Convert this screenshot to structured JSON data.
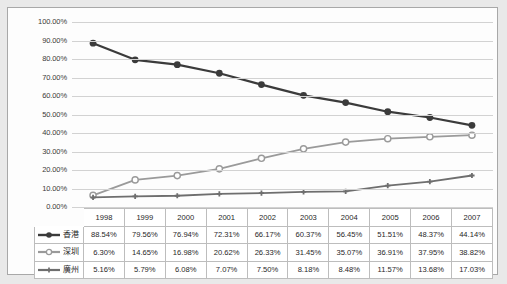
{
  "chart_data": {
    "type": "line",
    "title": "",
    "xlabel": "",
    "ylabel": "",
    "ylim": [
      0,
      100
    ],
    "y_tick_labels": [
      "100.00%",
      "90.00%",
      "80.00%",
      "70.00%",
      "60.00%",
      "50.00%",
      "40.00%",
      "30.00%",
      "20.00%",
      "10.00%",
      "0.00%"
    ],
    "y_tick_values": [
      100,
      90,
      80,
      70,
      60,
      50,
      40,
      30,
      20,
      10,
      0
    ],
    "grid": true,
    "legend_position": "left-table",
    "categories": [
      "1998",
      "1999",
      "2000",
      "2001",
      "2002",
      "2003",
      "2004",
      "2005",
      "2006",
      "2007"
    ],
    "series": [
      {
        "name": "香港",
        "marker": "filled-circle",
        "color": "#3b3b3b",
        "values": [
          88.54,
          79.56,
          76.94,
          72.31,
          66.17,
          60.37,
          56.45,
          51.51,
          48.37,
          44.14
        ],
        "labels": [
          "88.54%",
          "79.56%",
          "76.94%",
          "72.31%",
          "66.17%",
          "60.37%",
          "56.45%",
          "51.51%",
          "48.37%",
          "44.14%"
        ]
      },
      {
        "name": "深圳",
        "marker": "open-circle",
        "color": "#9a9a9a",
        "values": [
          6.3,
          14.65,
          16.98,
          20.62,
          26.33,
          31.45,
          35.07,
          36.91,
          37.95,
          38.82
        ],
        "labels": [
          "6.30%",
          "14.65%",
          "16.98%",
          "20.62%",
          "26.33%",
          "31.45%",
          "35.07%",
          "36.91%",
          "37.95%",
          "38.82%"
        ]
      },
      {
        "name": "廣州",
        "marker": "small-plus",
        "color": "#6e6e6e",
        "values": [
          5.16,
          5.79,
          6.08,
          7.07,
          7.5,
          8.18,
          8.48,
          11.57,
          13.68,
          17.03
        ],
        "labels": [
          "5.16%",
          "5.79%",
          "6.08%",
          "7.07%",
          "7.50%",
          "8.18%",
          "8.48%",
          "11.57%",
          "13.68%",
          "17.03%"
        ]
      }
    ]
  },
  "table": {
    "corner_label": "",
    "year_headers": [
      "1998",
      "1999",
      "2000",
      "2001",
      "2002",
      "2003",
      "2004",
      "2005",
      "2006",
      "2007"
    ],
    "rows": [
      {
        "legend_label": "香港",
        "cells": [
          "88.54%",
          "79.56%",
          "76.94%",
          "72.31%",
          "66.17%",
          "60.37%",
          "56.45%",
          "51.51%",
          "48.37%",
          "44.14%"
        ]
      },
      {
        "legend_label": "深圳",
        "cells": [
          "6.30%",
          "14.65%",
          "16.98%",
          "20.62%",
          "26.33%",
          "31.45%",
          "35.07%",
          "36.91%",
          "37.95%",
          "38.82%"
        ]
      },
      {
        "legend_label": "廣州",
        "cells": [
          "5.16%",
          "5.79%",
          "6.08%",
          "7.07%",
          "7.50%",
          "8.18%",
          "8.48%",
          "11.57%",
          "13.68%",
          "17.03%"
        ]
      }
    ]
  },
  "colors": {
    "series_1": "#3b3b3b",
    "series_2": "#9a9a9a",
    "series_3": "#6e6e6e",
    "gridline": "#d2d2d2",
    "frame_border": "#a8a8a8",
    "page_background": "#e9e9e9"
  }
}
